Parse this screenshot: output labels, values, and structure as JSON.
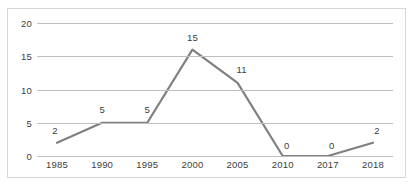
{
  "chart_data": {
    "type": "line",
    "title": "",
    "subtitle": "",
    "xlabel": "",
    "ylabel": "",
    "categories": [
      "1985",
      "1990",
      "1995",
      "2000",
      "2005",
      "2010",
      "2017",
      "2018"
    ],
    "values": [
      2,
      5,
      5,
      16,
      11,
      0,
      0,
      2
    ],
    "data_labels": [
      "2",
      "5",
      "5",
      "15",
      "11",
      "0",
      "0",
      "2"
    ],
    "series": [
      {
        "name": "",
        "values": [
          2,
          5,
          5,
          16,
          11,
          0,
          0,
          2
        ]
      }
    ],
    "ylim": [
      0,
      20
    ],
    "yticks": [
      0,
      5,
      10,
      15,
      20
    ],
    "ytick_labels": [
      "0",
      "5",
      "10",
      "15",
      "20"
    ],
    "grid": true,
    "grid_axis": "y",
    "legend": false,
    "legend_position": "none",
    "line_color": "#808080",
    "grid_color": "#bfbfbf",
    "text_color": "#3d3d3d",
    "background_color": "#ffffff",
    "border_color": "#d6d6d6",
    "markers": false,
    "show_data_labels": true
  },
  "caption": {
    "text": ""
  }
}
